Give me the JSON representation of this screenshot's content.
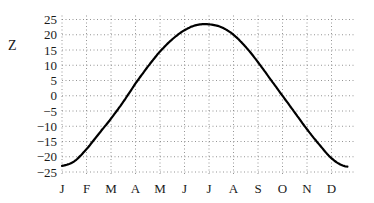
{
  "chart_data": {
    "type": "line",
    "title": "",
    "xlabel": "",
    "ylabel": "Z",
    "ylim": [
      -25,
      25
    ],
    "yticks": [
      25,
      20,
      15,
      10,
      5,
      0,
      -5,
      -10,
      -15,
      -20,
      -25
    ],
    "ytick_labels": [
      "25",
      "20",
      "15",
      "10",
      "5",
      "0",
      "−5",
      "−10",
      "−15",
      "−20",
      "−25"
    ],
    "categories": [
      "J",
      "F",
      "M",
      "A",
      "M",
      "J",
      "J",
      "A",
      "S",
      "O",
      "N",
      "D"
    ],
    "grid": true,
    "legend": null,
    "series": [
      {
        "name": "Z",
        "color": "#000000",
        "x": [
          0,
          0.5,
          1,
          1.5,
          2,
          2.5,
          3,
          3.5,
          4,
          4.5,
          5,
          5.5,
          6,
          6.5,
          7,
          7.5,
          8,
          8.5,
          9,
          9.5,
          10,
          10.5,
          11,
          11.5
        ],
        "values": [
          -23.0,
          -21.5,
          -17.5,
          -12.5,
          -7.5,
          -2.0,
          4.0,
          9.5,
          14.5,
          18.5,
          21.5,
          23.2,
          23.4,
          22.5,
          20.0,
          16.0,
          11.0,
          5.5,
          0,
          -5.5,
          -11.0,
          -16.0,
          -20.5,
          -23.0
        ]
      }
    ]
  }
}
